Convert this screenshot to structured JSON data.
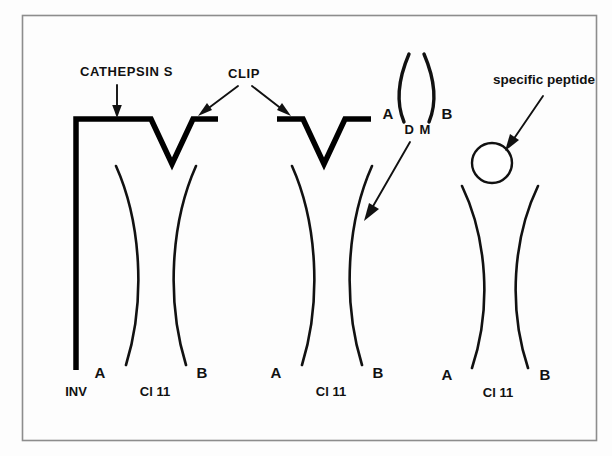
{
  "figure": {
    "background_color": "#fdfdfd",
    "frame_color": "#8d8d8d",
    "ink_color": "#111111"
  },
  "annotations": {
    "cathepsin": "CATHEPSIN  S",
    "clip": "CLIP",
    "dm": "D M",
    "specific_peptide": "specific peptide"
  },
  "complexes": [
    {
      "id": "complex-1",
      "left_label": "INV",
      "alpha_label": "A",
      "beta_label": "B",
      "class_label": "Cl 11",
      "bound_ligand": "invariant-chain"
    },
    {
      "id": "complex-2",
      "alpha_label": "A",
      "beta_label": "B",
      "class_label": "Cl 11",
      "bound_ligand": "clip-peptide"
    },
    {
      "id": "complex-3",
      "alpha_label": "A",
      "beta_label": "B",
      "class_label": "Cl 11",
      "bound_ligand": "specific-peptide"
    }
  ],
  "dm_molecule": {
    "alpha_label": "A",
    "beta_label": "B",
    "name_label": "D M"
  }
}
